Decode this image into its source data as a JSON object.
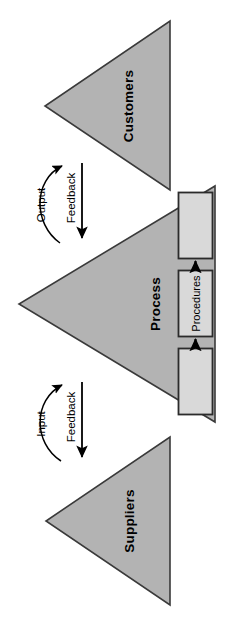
{
  "diagram": {
    "orientation": "rotated-90-ccw",
    "colors": {
      "background": "#ffffff",
      "triangle_fill": "#b3b3b3",
      "triangle_stroke": "#3a3a3a",
      "box_fill": "#d9d9d9",
      "box_stroke": "#2b2b2b",
      "text": "#000000",
      "arrow": "#000000"
    },
    "triangles": [
      {
        "id": "customers",
        "label": "Customers"
      },
      {
        "id": "process",
        "label": "Process"
      },
      {
        "id": "suppliers",
        "label": "Suppliers"
      }
    ],
    "flows": [
      {
        "id": "output",
        "label": "Output",
        "from": "process",
        "to": "customers",
        "style": "curved-arrow"
      },
      {
        "id": "feedback-customers",
        "label": "Feedback",
        "from": "customers",
        "to": "process",
        "style": "straight-arrow"
      },
      {
        "id": "input",
        "label": "Input",
        "from": "suppliers",
        "to": "process",
        "style": "curved-arrow"
      },
      {
        "id": "feedback-suppliers",
        "label": "Feedback",
        "from": "process",
        "to": "suppliers",
        "style": "straight-arrow"
      }
    ],
    "boxes": [
      {
        "id": "box-upper",
        "label": ""
      },
      {
        "id": "box-procedures",
        "label": "Procedures"
      },
      {
        "id": "box-lower",
        "label": ""
      }
    ],
    "box_connectors": [
      {
        "id": "connector-lower-to-procedures",
        "from": "box-lower",
        "to": "box-procedures",
        "style": "arrow"
      },
      {
        "id": "connector-procedures-to-upper",
        "from": "box-procedures",
        "to": "box-upper",
        "style": "arrow"
      }
    ]
  }
}
